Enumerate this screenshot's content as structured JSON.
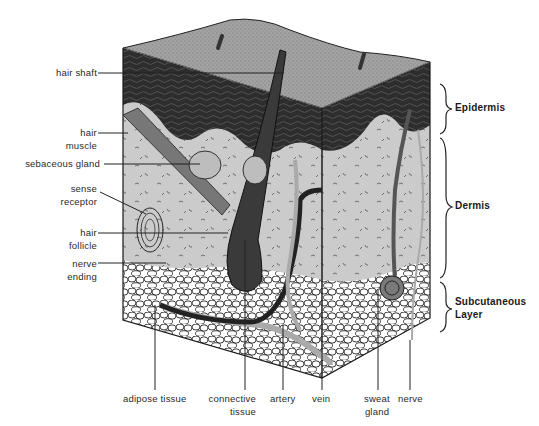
{
  "diagram": {
    "colors": {
      "background": "#ffffff",
      "epidermis_top": "#9a9a9a",
      "epidermis_dark": "#2b2b2b",
      "dermis": "#c9c9c9",
      "subcutaneous_fat": "#ffffff",
      "outline": "#1a1a1a"
    },
    "left_labels": [
      {
        "id": "hair-shaft",
        "lines": [
          "hair shaft"
        ]
      },
      {
        "id": "hair-muscle",
        "lines": [
          "hair",
          "muscle"
        ]
      },
      {
        "id": "sebaceous-gland",
        "lines": [
          "sebaceous gland"
        ]
      },
      {
        "id": "sense-receptor",
        "lines": [
          "sense",
          "receptor"
        ]
      },
      {
        "id": "hair-follicle",
        "lines": [
          "hair",
          "follicle"
        ]
      },
      {
        "id": "nerve-ending",
        "lines": [
          "nerve",
          "ending"
        ]
      }
    ],
    "layer_labels": [
      {
        "id": "epidermis",
        "lines": [
          "Epidermis"
        ]
      },
      {
        "id": "dermis",
        "lines": [
          "Dermis"
        ]
      },
      {
        "id": "subcutaneous",
        "lines": [
          "Subcutaneous",
          "Layer"
        ]
      }
    ],
    "bottom_labels": [
      {
        "id": "adipose-tissue",
        "lines": [
          "adipose tissue"
        ]
      },
      {
        "id": "connective-tissue",
        "lines": [
          "connective",
          "tissue"
        ]
      },
      {
        "id": "artery",
        "lines": [
          "artery"
        ]
      },
      {
        "id": "vein",
        "lines": [
          "vein"
        ]
      },
      {
        "id": "sweat-gland",
        "lines": [
          "sweat",
          "gland"
        ]
      },
      {
        "id": "nerve",
        "lines": [
          "nerve"
        ]
      }
    ]
  }
}
